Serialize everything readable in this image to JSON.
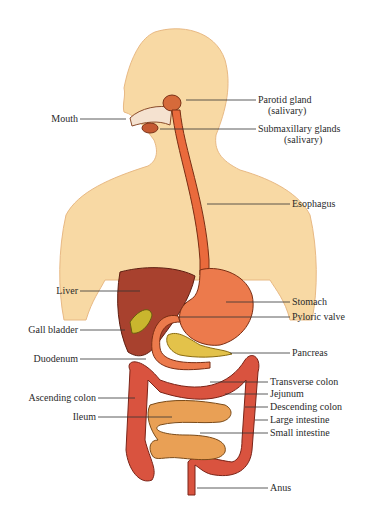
{
  "colors": {
    "skin": "#f8d7a0",
    "skin_shade": "#eec38a",
    "esophagus": "#ea6a3c",
    "stomach": "#ec7a4c",
    "liver": "#a8412e",
    "gall_bladder": "#c9b62e",
    "pancreas": "#e3c24a",
    "large_intestine": "#d9533f",
    "small_intestine": "#e9a055",
    "leader_line": "#333333"
  },
  "labels": {
    "mouth": "Mouth",
    "parotid": "Parotid gland",
    "parotid_sub": "(salivary)",
    "submaxillary": "Submaxillary glands",
    "submaxillary_sub": "(salivary)",
    "esophagus": "Esophagus",
    "liver": "Liver",
    "stomach": "Stomach",
    "pyloric": "Pyloric valve",
    "gall_bladder": "Gall bladder",
    "duodenum": "Duodenum",
    "pancreas": "Pancreas",
    "transverse_colon": "Transverse colon",
    "jejunum": "Jejunum",
    "ascending_colon": "Ascending colon",
    "descending_colon": "Descending colon",
    "ileum": "Ileum",
    "large_intestine": "Large intestine",
    "small_intestine": "Small intestine",
    "anus": "Anus"
  }
}
